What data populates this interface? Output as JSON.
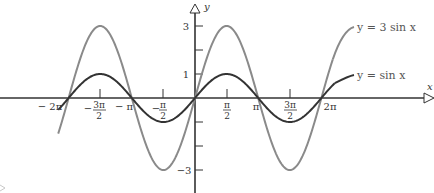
{
  "chart_data": {
    "type": "line",
    "title": "",
    "xlabel": "x",
    "ylabel": "y",
    "xlim": [
      -6.6,
      8.0
    ],
    "ylim": [
      -3.6,
      3.6
    ],
    "grid": false,
    "x_ticks": [
      "-2π",
      "-3π/2",
      "-π",
      "-π/2",
      "π/2",
      "π",
      "3π/2",
      "2π"
    ],
    "y_ticks": [
      "3",
      "1",
      "-1",
      "-3"
    ],
    "series": [
      {
        "name": "y = 3 sin x",
        "color": "#8a8a8a",
        "function": "3*sin(x)",
        "x_range": [
          -6.8,
          6.9
        ],
        "x": [
          -6.283,
          -4.712,
          -3.142,
          -1.571,
          0,
          1.571,
          3.142,
          4.712,
          6.283
        ],
        "values": [
          0,
          3,
          0,
          -3,
          0,
          3,
          0,
          -3,
          0
        ]
      },
      {
        "name": "y = sin x",
        "color": "#333333",
        "function": "sin(x)",
        "x_range": [
          -6.8,
          6.9
        ],
        "x": [
          -6.283,
          -4.712,
          -3.142,
          -1.571,
          0,
          1.571,
          3.142,
          4.712,
          6.283
        ],
        "values": [
          0,
          1,
          0,
          -1,
          0,
          1,
          0,
          -1,
          0
        ]
      }
    ],
    "legend": {
      "position": "inline-right",
      "entries": [
        "y = 3 sin x",
        "y = sin x"
      ]
    }
  },
  "labels": {
    "x_axis": "x",
    "y_axis": "y",
    "legend_3sin": "y = 3 sin x",
    "legend_sin": "y = sin x",
    "x_neg2pi": "− 2π",
    "x_negpi": "− π",
    "x_pi": "π",
    "x_2pi": "2π",
    "x_neg3pi2_num": "3π",
    "x_negpi2_num": "π",
    "x_pi2_num": "π",
    "x_3pi2_num": "3π",
    "x_den": "2",
    "minus": "−",
    "y_3": "3",
    "y_1": "1",
    "y_neg3": "−3"
  }
}
